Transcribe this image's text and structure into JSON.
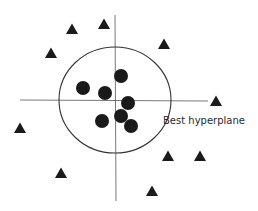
{
  "diagram": {
    "label": "Best hyperplane",
    "colors": {
      "ink": "#1a1a1a",
      "line": "#555555",
      "background": "#ffffff"
    },
    "axes": {
      "horizontal": {
        "x1": 20,
        "y1": 100,
        "x2": 208,
        "y2": 101
      },
      "vertical": {
        "x1": 115,
        "y1": 15,
        "x2": 116,
        "y2": 201
      }
    },
    "boundary": {
      "shape": "circle",
      "cx": 115,
      "cy": 100,
      "rx": 56,
      "ry": 53
    },
    "class_circles": [
      {
        "x": 83,
        "y": 88
      },
      {
        "x": 105,
        "y": 93
      },
      {
        "x": 121,
        "y": 76
      },
      {
        "x": 128,
        "y": 103
      },
      {
        "x": 102,
        "y": 121
      },
      {
        "x": 121,
        "y": 116
      },
      {
        "x": 131,
        "y": 126
      }
    ],
    "class_triangles": [
      {
        "x": 72,
        "y": 29
      },
      {
        "x": 104,
        "y": 24
      },
      {
        "x": 51,
        "y": 53
      },
      {
        "x": 164,
        "y": 44
      },
      {
        "x": 216,
        "y": 101
      },
      {
        "x": 20,
        "y": 128
      },
      {
        "x": 168,
        "y": 156
      },
      {
        "x": 200,
        "y": 156
      },
      {
        "x": 61,
        "y": 173
      },
      {
        "x": 152,
        "y": 191
      }
    ]
  }
}
